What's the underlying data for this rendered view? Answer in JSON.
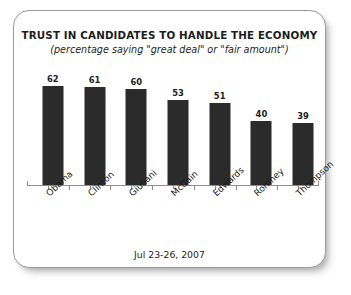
{
  "chart_data": {
    "type": "bar",
    "title": "TRUST IN CANDIDATES TO HANDLE THE ECONOMY",
    "subtitle": "(percentage saying \"great deal\" or \"fair amount\")",
    "footnote": "Jul 23-26, 2007",
    "categories": [
      "Obama",
      "Clinton",
      "Giuliani",
      "McCain",
      "Edwards",
      "Romney",
      "Thompson"
    ],
    "values": [
      62,
      61,
      60,
      53,
      51,
      40,
      39
    ],
    "xlabel": "",
    "ylabel": "",
    "ylim": [
      0,
      70
    ],
    "grid": false,
    "legend": false,
    "bar_color": "#2b2b2b",
    "axis_color": "#8e8e8e",
    "text_color": "#1d1d1d",
    "card_border_color": "#9a9a9a",
    "background": "#ffffff"
  }
}
